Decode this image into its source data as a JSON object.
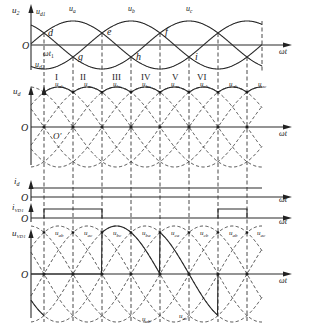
{
  "figure": {
    "panels": [
      {
        "id": "phase-voltages",
        "y_label": "u₂",
        "origin": "O",
        "x_label": "ωt",
        "curves": [
          "uₐ",
          "u_b",
          "u_c"
        ],
        "envelope_labels": {
          "upper": "u_d1",
          "lower": "u_d2"
        },
        "natural_commutation_points_upper": [
          "d",
          "e",
          "f"
        ],
        "natural_commutation_points_lower": [
          "g",
          "h",
          "i"
        ],
        "angle_label": "ωt₁",
        "intervals": [
          "I",
          "II",
          "III",
          "IV",
          "V",
          "VI"
        ]
      },
      {
        "id": "output-voltage",
        "y_label": "u_d",
        "origin": "O",
        "origin2": "O′",
        "x_label": "ωt",
        "segment_labels": [
          "u_ab",
          "u_ac",
          "u_bc",
          "u_ba",
          "u_ca",
          "u_cb",
          "u_ab",
          "u_ac"
        ]
      },
      {
        "id": "load-current",
        "y_label": "i_d",
        "origin": "O",
        "x_label": "ωt"
      },
      {
        "id": "diode-current",
        "y_label": "i_VD1",
        "origin": "O",
        "x_label": "ωt"
      },
      {
        "id": "diode-voltage",
        "y_label": "u_VD1",
        "origin": "O",
        "x_label": "ωt",
        "top_labels": [
          "u_ab",
          "u_ac",
          "u_bc",
          "u_ba",
          "u_ca",
          "u_cb",
          "u_ab",
          "u_ac"
        ],
        "bottom_labels": [
          "u_ab",
          "u_ac"
        ]
      }
    ]
  },
  "labels": {
    "u2": "u",
    "u2_sub": "2",
    "ud1": "u",
    "ud1_sub": "d1",
    "ud2": "u",
    "ud2_sub": "d2",
    "ua": "u",
    "ua_sub": "a",
    "ub": "u",
    "ub_sub": "b",
    "uc": "u",
    "uc_sub": "c",
    "O": "O",
    "Oprime": "O′",
    "wt": "ωt",
    "wt1": "ωt",
    "wt1_sub": "1",
    "d": "d",
    "e": "e",
    "f": "f",
    "g": "g",
    "h": "h",
    "i": "i",
    "ud": "u",
    "ud_sub": "d",
    "id": "i",
    "id_sub": "d",
    "ivd": "i",
    "ivd_sub": "VD1",
    "uvd": "u",
    "uvd_sub": "VD1",
    "roman": [
      "I",
      "II",
      "III",
      "IV",
      "V",
      "VI"
    ],
    "line_sub": [
      "ab",
      "ac",
      "bc",
      "ba",
      "ca",
      "cb",
      "ab",
      "ac"
    ],
    "vd_top_sub": [
      "ab",
      "ac",
      "bc",
      "ba",
      "ca",
      "cb",
      "ab",
      "ac"
    ],
    "vd_bottom_sub": [
      "ab",
      "ac"
    ]
  },
  "geometry": {
    "axis_x": 31,
    "x_start": 31,
    "x_end": 262,
    "arrow_end": 292,
    "period_px": 174,
    "t0_x": 44,
    "grid_x": [
      44,
      73,
      102,
      131,
      160,
      189,
      218,
      247
    ],
    "top_axis_y": 45,
    "top_amp": 24,
    "ud_axis_y": 127,
    "ud_amp": 40,
    "id_line_y": 188,
    "id_axis_y": 197,
    "ivd_top_y": 209,
    "ivd_axis_y": 218,
    "vd_axis_y": 274,
    "vd_amp": 48
  },
  "colors": {
    "ink": "#2a2a2a",
    "background": "#ffffff"
  }
}
